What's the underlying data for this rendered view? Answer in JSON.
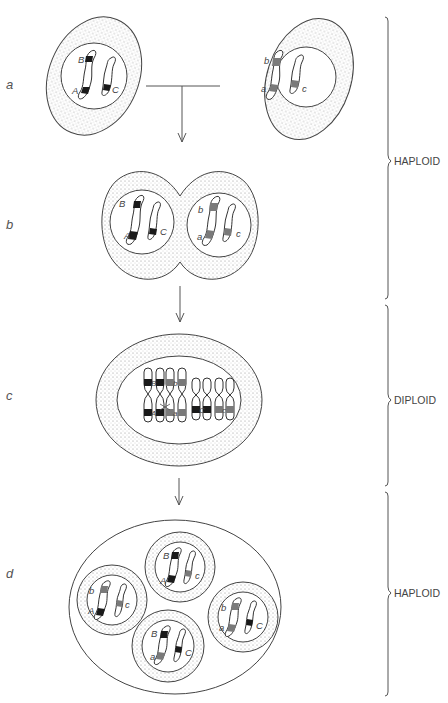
{
  "figure": {
    "stages": [
      {
        "id": "a",
        "label": "a"
      },
      {
        "id": "b",
        "label": "b"
      },
      {
        "id": "c",
        "label": "c"
      },
      {
        "id": "d",
        "label": "d"
      }
    ],
    "ploidy": [
      {
        "label": "HAPLOID",
        "stages": [
          "a",
          "b"
        ]
      },
      {
        "label": "DIPLOID",
        "stages": [
          "c"
        ]
      },
      {
        "label": "HAPLOID",
        "stages": [
          "d"
        ]
      }
    ],
    "colors": {
      "dominant_band": "#1a1a1a",
      "recessive_band": "#7a7a7a",
      "outline": "#444444",
      "cytoplasm_dots": "#9a9a9a"
    },
    "cells": {
      "a_left": {
        "alleles": [
          "B",
          "A",
          "C"
        ]
      },
      "a_right": {
        "alleles": [
          "b",
          "a",
          "c"
        ]
      },
      "b_left": {
        "alleles": [
          "B",
          "A",
          "C"
        ]
      },
      "b_right": {
        "alleles": [
          "b",
          "a",
          "c"
        ]
      },
      "c_diploid": {
        "alleles": [
          "B",
          "b",
          "A",
          "a",
          "C",
          "c"
        ]
      },
      "d_top": {
        "alleles": [
          "B",
          "A",
          "c"
        ]
      },
      "d_left": {
        "alleles": [
          "b",
          "A",
          "c"
        ]
      },
      "d_right": {
        "alleles": [
          "b",
          "a",
          "C"
        ]
      },
      "d_bottom": {
        "alleles": [
          "B",
          "a",
          "C"
        ]
      }
    }
  }
}
